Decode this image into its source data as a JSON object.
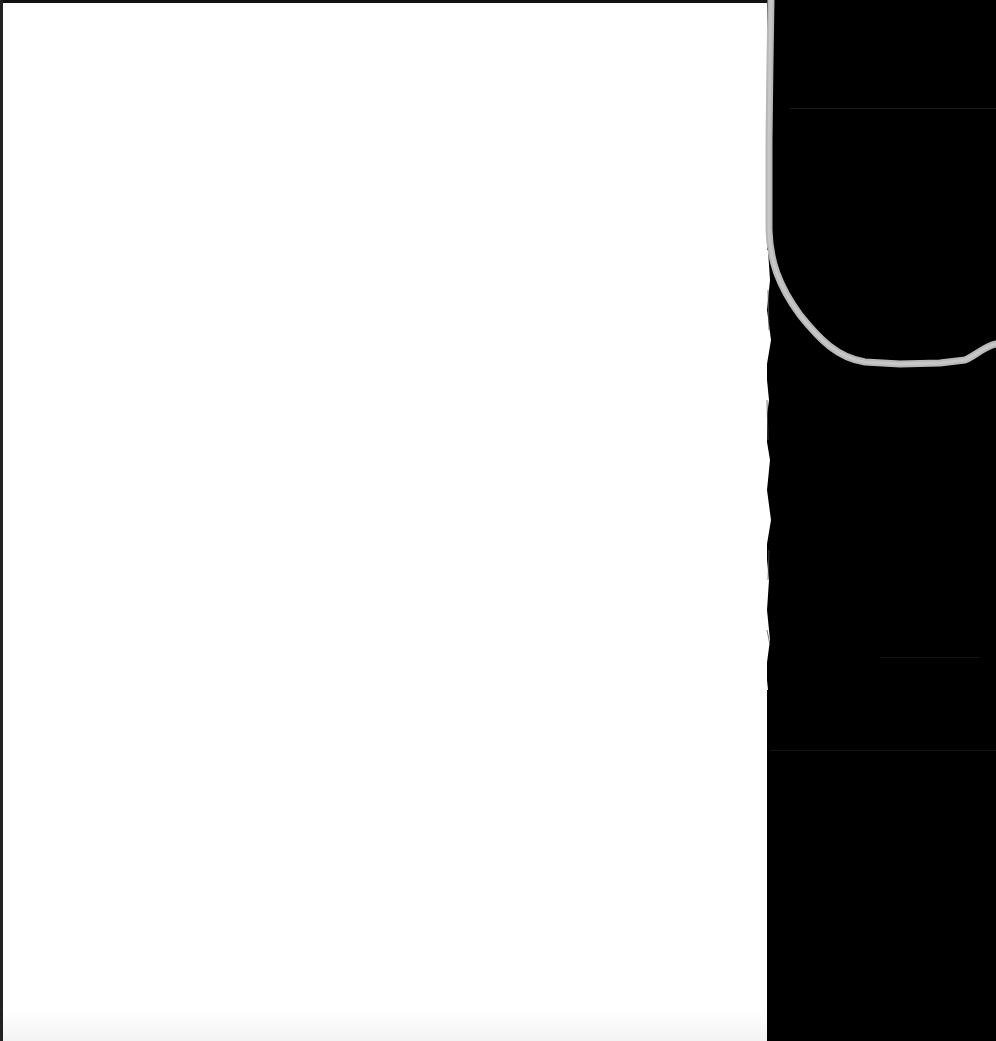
{
  "scan": {
    "description": "Scanned blank paper page on dark scanner background",
    "page_color": "#ffffff",
    "background_color": "#000000",
    "thread_color": "#b8b8b8",
    "text_content": ""
  },
  "page": {
    "text": ""
  }
}
